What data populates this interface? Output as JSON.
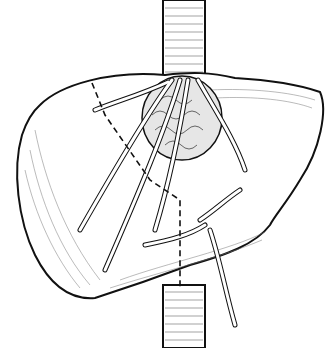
{
  "illustration": {
    "subject": "liver with caudate tumor and dashed resection line",
    "colors": {
      "stroke": "#111111",
      "fill": "#ffffff",
      "hatch": "#555555"
    }
  }
}
